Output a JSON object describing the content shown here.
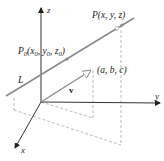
{
  "diagram": {
    "axes": {
      "z_label": "z",
      "y_label": "y",
      "x_label": "x"
    },
    "labels": {
      "point_p": "P(x, y, z)",
      "point_p0_prefix": "P",
      "point_p0_sub": "0",
      "point_p0_rest_1": "(x",
      "point_p0_sub_x": "0",
      "point_p0_rest_2": ", y",
      "point_p0_sub_y": "0",
      "point_p0_rest_3": ", z",
      "point_p0_sub_z": "0",
      "point_p0_rest_4": ")",
      "line_l": "L",
      "vector_v": "v",
      "vector_components": "(a, b, c)"
    },
    "colors": {
      "axis": "#333333",
      "line": "#8a8a8a",
      "dashed": "#aaaaaa",
      "point": "#888888"
    }
  }
}
